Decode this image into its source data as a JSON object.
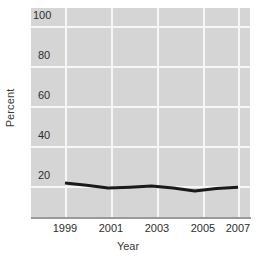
{
  "chart_data": {
    "type": "line",
    "title": "",
    "xlabel": "Year",
    "ylabel": "Percent",
    "x": [
      1999,
      2000,
      2001,
      2002,
      2003,
      2004,
      2005,
      2006,
      2007
    ],
    "series": [
      {
        "name": "Percent",
        "values": [
          21.5,
          20.4,
          19.0,
          19.4,
          20.0,
          19.0,
          17.5,
          18.8,
          19.4
        ],
        "color": "#1a1a1a",
        "line_width": 3
      }
    ],
    "xlim": [
      1999,
      2007
    ],
    "ylim": [
      0,
      105
    ],
    "xticks": [
      1999,
      2001,
      2003,
      2005,
      2007
    ],
    "xtick_labels": [
      "1999",
      "2001",
      "2003",
      "2005",
      "2007"
    ],
    "yticks": [
      20,
      40,
      60,
      80,
      100
    ],
    "ytick_labels": [
      "20",
      "40",
      "60",
      "80",
      "100"
    ],
    "grid": true,
    "grid_color": "#f6f6f6",
    "plot_background": "#d5d5d5",
    "figure_background": "#ffffff",
    "legend": null
  },
  "axes": {
    "y_label": "Percent",
    "x_label": "Year",
    "y_tick_labels": [
      "100",
      "80",
      "60",
      "40",
      "20"
    ],
    "x_tick_labels": [
      "1999",
      "2001",
      "2003",
      "2005",
      "2007"
    ]
  }
}
